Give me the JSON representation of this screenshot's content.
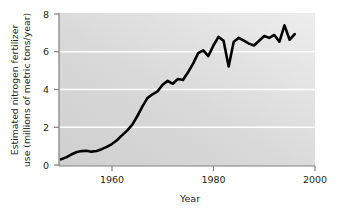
{
  "chart_data": {
    "type": "line",
    "title": "",
    "xlabel": "Year",
    "ylabel": "Estimated nitrogen fertilizer use (millions of metric tons/year)",
    "ylabel_line1": "Estimated nitrogen fertilizer",
    "ylabel_line2": "use (millions of metric tons/year)",
    "xlim": [
      1949.6,
      2000
    ],
    "ylim": [
      0,
      8
    ],
    "xticks": [
      1960,
      1980,
      2000
    ],
    "xtick_labels": [
      "1960",
      "1980",
      "2000"
    ],
    "yticks": [
      0,
      2,
      4,
      6,
      8
    ],
    "ytick_labels": [
      "0",
      "2",
      "4",
      "6",
      "8"
    ],
    "gridlines_y": [
      2,
      4,
      6
    ],
    "grid": true,
    "grid_color": "#ffffff",
    "legend": null,
    "line_color": "#000000",
    "line_width": 2.6,
    "plot_background": "#d4d4d4",
    "plot_background_light": "#eaeaea",
    "axis_color": "#7d7d7d",
    "x": [
      1950,
      1951,
      1952,
      1953,
      1954,
      1955,
      1956,
      1957,
      1958,
      1959,
      1960,
      1961,
      1962,
      1963,
      1964,
      1965,
      1966,
      1967,
      1968,
      1969,
      1970,
      1971,
      1972,
      1973,
      1974,
      1975,
      1976,
      1977,
      1978,
      1979,
      1980,
      1981,
      1982,
      1983,
      1984,
      1985,
      1986,
      1987,
      1988,
      1989,
      1990,
      1991,
      1992,
      1993,
      1994,
      1995,
      1996
    ],
    "values": [
      0.35,
      0.45,
      0.6,
      0.72,
      0.78,
      0.8,
      0.75,
      0.78,
      0.88,
      1.0,
      1.15,
      1.35,
      1.6,
      1.85,
      2.15,
      2.6,
      3.1,
      3.55,
      3.75,
      3.9,
      4.25,
      4.45,
      4.3,
      4.55,
      4.5,
      4.9,
      5.35,
      5.9,
      6.05,
      5.75,
      6.3,
      6.75,
      6.55,
      5.2,
      6.5,
      6.7,
      6.55,
      6.4,
      6.3,
      6.55,
      6.8,
      6.7,
      6.85,
      6.5,
      7.35,
      6.6,
      6.9
    ]
  },
  "accessibility": {
    "figure_name": "nitrogen-fertilizer-use-line-chart"
  }
}
